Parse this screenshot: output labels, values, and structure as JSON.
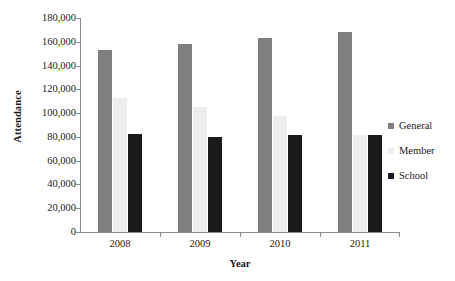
{
  "chart_data": {
    "type": "bar",
    "title": "",
    "xlabel": "Year",
    "ylabel": "Attendance",
    "categories": [
      "2008",
      "2009",
      "2010",
      "2011"
    ],
    "series": [
      {
        "name": "General",
        "color": "#807f7f",
        "values": [
          153000,
          158000,
          163000,
          168500
        ]
      },
      {
        "name": "Member",
        "color": "#ededed",
        "values": [
          113000,
          105000,
          98000,
          82000
        ]
      },
      {
        "name": "School",
        "color": "#1a1a1a",
        "values": [
          82500,
          80000,
          82000,
          81500
        ]
      }
    ],
    "ylim": [
      0,
      180000
    ],
    "yticks": [
      0,
      20000,
      40000,
      60000,
      80000,
      100000,
      120000,
      140000,
      160000,
      180000
    ],
    "ytick_labels": [
      "0",
      "20,000",
      "40,000",
      "60,000",
      "80,000",
      "100,000",
      "120,000",
      "140,000",
      "160,000",
      "180,000"
    ],
    "grid": false,
    "legend_position": "right"
  }
}
